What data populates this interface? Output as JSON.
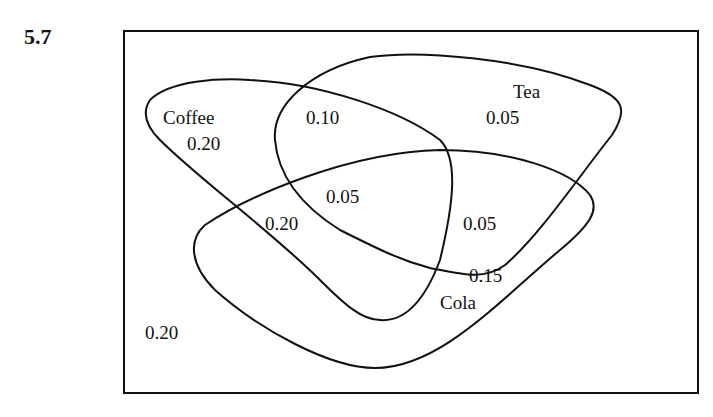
{
  "problem_number": "5.7",
  "venn": {
    "sets": [
      {
        "name": "Coffee",
        "label": "Coffee"
      },
      {
        "name": "Tea",
        "label": "Tea"
      },
      {
        "name": "Cola",
        "label": "Cola"
      }
    ],
    "regions": {
      "coffee_only": "0.20",
      "tea_only": "0.05",
      "cola_only": "0.15",
      "coffee_tea_only": "0.10",
      "coffee_cola_only": "0.20",
      "tea_cola_only": "0.05",
      "all_three": "0.05",
      "none": "0.20"
    },
    "colors": {
      "stroke": "#111111",
      "background": "#ffffff"
    }
  }
}
